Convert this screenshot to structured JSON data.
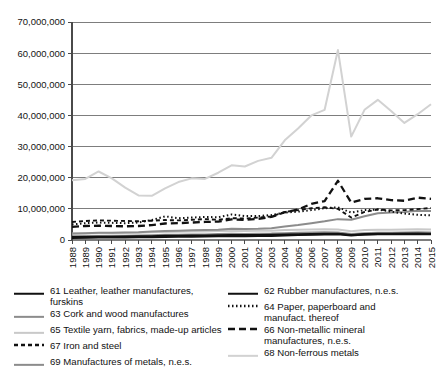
{
  "chart_data": {
    "type": "line",
    "title": "",
    "xlabel": "",
    "ylabel": "",
    "grid": true,
    "legend_position": "bottom",
    "ylim": [
      0,
      70000000
    ],
    "yticks": [
      0,
      10000000,
      20000000,
      30000000,
      40000000,
      50000000,
      60000000,
      70000000
    ],
    "ytick_labels": [
      "0",
      "10,000,000",
      "20,000,000",
      "30,000,000",
      "40,000,000",
      "50,000,000",
      "60,000,000",
      "70,000,000"
    ],
    "categories": [
      1988,
      1989,
      1990,
      1991,
      1992,
      1993,
      1994,
      1995,
      1996,
      1997,
      1998,
      1999,
      2000,
      2001,
      2002,
      2003,
      2004,
      2005,
      2006,
      2007,
      2008,
      2009,
      2010,
      2011,
      2012,
      2013,
      2014,
      2015
    ],
    "xtick_labels": [
      "1988",
      "1989",
      "1990",
      "1991",
      "1992",
      "1993",
      "1994",
      "1995",
      "1996",
      "1997",
      "1998",
      "1999",
      "2000",
      "2001",
      "2002",
      "2003",
      "2004",
      "2005",
      "2006",
      "2007",
      "2008",
      "2009",
      "2010",
      "2011",
      "2012",
      "2013",
      "2014",
      "2015"
    ],
    "series": [
      {
        "key": "s61",
        "name": "61 Leather, leather manufactures, furskins",
        "code": "61",
        "color": "#111111",
        "width": 2.2,
        "dash": "none",
        "values": [
          900000,
          950000,
          1000000,
          1050000,
          1100000,
          1150000,
          1200000,
          1300000,
          1350000,
          1400000,
          1450000,
          1500000,
          1600000,
          1550000,
          1600000,
          1650000,
          1750000,
          1800000,
          1900000,
          1950000,
          2000000,
          1600000,
          1800000,
          1900000,
          1900000,
          1950000,
          1900000,
          1850000
        ]
      },
      {
        "key": "s63",
        "name": "63 Cork and wood manufactures",
        "code": "63",
        "color": "#8c8c8c",
        "width": 2.0,
        "dash": "none",
        "values": [
          1200000,
          1250000,
          1300000,
          1350000,
          1400000,
          1450000,
          1550000,
          1650000,
          1700000,
          1750000,
          1800000,
          1900000,
          2000000,
          1950000,
          2000000,
          2050000,
          2200000,
          2300000,
          2400000,
          2450000,
          2400000,
          1900000,
          2200000,
          2300000,
          2300000,
          2400000,
          2450000,
          2400000
        ]
      },
      {
        "key": "s65",
        "name": "65 Textile yarn, fabrics, made-up articles",
        "code": "65",
        "color": "#c9c9c9",
        "width": 2.0,
        "dash": "none",
        "values": [
          2000000,
          2100000,
          2200000,
          2250000,
          2300000,
          2350000,
          2450000,
          2600000,
          2650000,
          2700000,
          2750000,
          2850000,
          3000000,
          2900000,
          2950000,
          3000000,
          3200000,
          3300000,
          3400000,
          3450000,
          3400000,
          2800000,
          3200000,
          3300000,
          3300000,
          3400000,
          3450000,
          3400000
        ]
      },
      {
        "key": "s67",
        "name": "67 Iron and steel",
        "code": "67",
        "color": "#111111",
        "width": 1.9,
        "dash": "4,3",
        "values": [
          5800000,
          6100000,
          6300000,
          6200000,
          6100000,
          6000000,
          6200000,
          6400000,
          6300000,
          6500000,
          6700000,
          6500000,
          7000000,
          6900000,
          7200000,
          7600000,
          9000000,
          9600000,
          10200000,
          10500000,
          10000000,
          7200000,
          9000000,
          9800000,
          9500000,
          9600000,
          9900000,
          10300000
        ]
      },
      {
        "key": "s69",
        "name": "69 Manufactures of metals, n.e.s.",
        "code": "69",
        "color": "#8c8c8c",
        "width": 2.0,
        "dash": "none",
        "values": [
          2100000,
          2200000,
          2300000,
          2350000,
          2400000,
          2500000,
          2700000,
          2900000,
          3000000,
          3100000,
          3200000,
          3300000,
          3600000,
          3500000,
          3600000,
          3800000,
          4300000,
          4800000,
          5400000,
          6000000,
          6700000,
          6500000,
          7600000,
          8600000,
          8800000,
          9000000,
          9400000,
          9300000
        ]
      },
      {
        "key": "s62",
        "name": "62 Rubber manufactures, n.e.s.",
        "code": "62",
        "color": "#111111",
        "width": 2.2,
        "dash": "none",
        "values": [
          700000,
          750000,
          800000,
          830000,
          860000,
          900000,
          950000,
          1000000,
          1050000,
          1100000,
          1150000,
          1200000,
          1300000,
          1250000,
          1300000,
          1350000,
          1500000,
          1600000,
          1700000,
          1800000,
          1850000,
          1500000,
          1800000,
          1950000,
          1950000,
          2000000,
          2050000,
          2000000
        ]
      },
      {
        "key": "s64",
        "name": "64 Paper, paperboard and\nmanufact. thereof",
        "code": "64",
        "color": "#111111",
        "width": 2.0,
        "dash": "1.5,2.5",
        "values": [
          5000000,
          5400000,
          5600000,
          5500000,
          5400000,
          5600000,
          6400000,
          7600000,
          7000000,
          7200000,
          7400000,
          7300000,
          8200000,
          7700000,
          7700000,
          8000000,
          8800000,
          9100000,
          9600000,
          10200000,
          10500000,
          8800000,
          9600000,
          9800000,
          9100000,
          8500000,
          8100000,
          7900000
        ]
      },
      {
        "key": "s66",
        "name": "66 Non-metallic mineral\nmanufactures, n.e.s.",
        "code": "66",
        "color": "#111111",
        "width": 2.3,
        "dash": "7,4",
        "values": [
          4200000,
          4500000,
          4600000,
          4500000,
          4400000,
          4500000,
          4800000,
          5300000,
          5400000,
          5600000,
          5800000,
          5900000,
          6600000,
          6500000,
          6800000,
          7400000,
          8900000,
          9800000,
          11600000,
          12500000,
          19000000,
          12000000,
          13200000,
          13400000,
          12800000,
          12600000,
          13600000,
          13200000
        ]
      },
      {
        "key": "s68",
        "name": "68 Non-ferrous metals",
        "code": "68",
        "color": "#d2d2d2",
        "width": 2.0,
        "dash": "none",
        "values": [
          19200000,
          19600000,
          22000000,
          19800000,
          16800000,
          14300000,
          14200000,
          16600000,
          18600000,
          19800000,
          19600000,
          21600000,
          24000000,
          23600000,
          25400000,
          26400000,
          32000000,
          35800000,
          40000000,
          41800000,
          61000000,
          33200000,
          41800000,
          45000000,
          41400000,
          37600000,
          40400000,
          43600000
        ]
      }
    ]
  },
  "legend": {
    "left_column": [
      {
        "code": "61",
        "label": "61 Leather, leather manufactures, furskins"
      },
      {
        "code": "63",
        "label": "63 Cork and wood manufactures"
      },
      {
        "code": "65",
        "label": "65 Textile yarn, fabrics, made-up articles"
      },
      {
        "code": "67",
        "label": "67 Iron and steel"
      },
      {
        "code": "69",
        "label": "69 Manufactures of metals, n.e.s."
      }
    ],
    "right_column": [
      {
        "code": "62",
        "label": "62 Rubber manufactures, n.e.s."
      },
      {
        "code": "64",
        "label": "64 Paper, paperboard and\nmanufact. thereof"
      },
      {
        "code": "66",
        "label": "66 Non-metallic mineral\nmanufactures, n.e.s."
      },
      {
        "code": "68",
        "label": "68 Non-ferrous metals"
      }
    ]
  },
  "colors": {
    "axis": "#4a4a4a",
    "grid": "#7d7d7d",
    "background": "#ffffff",
    "text": "#111111"
  }
}
